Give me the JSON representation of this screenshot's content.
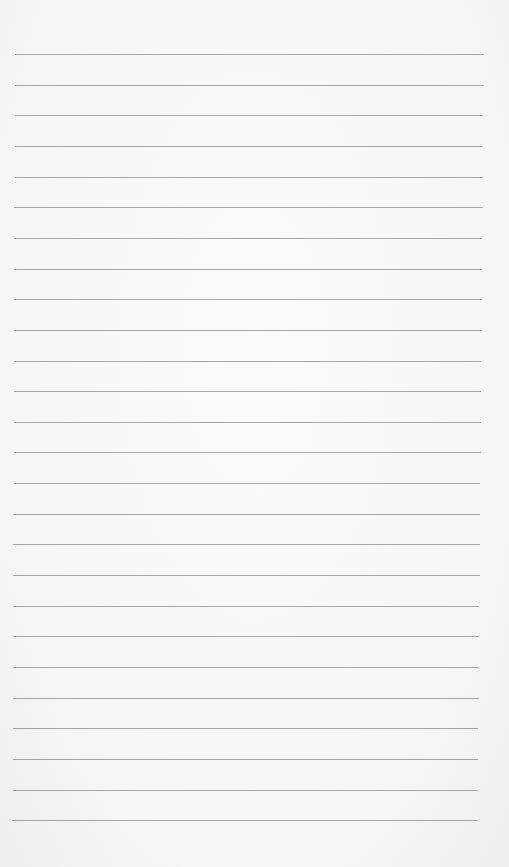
{
  "page": {
    "type": "lined-paper",
    "background_color": "#f7f7f5",
    "line_color": "#8a8a88",
    "line_count": 26,
    "first_line_y": 54,
    "line_spacing": 30.65,
    "line_left": 15,
    "line_right": 484
  }
}
